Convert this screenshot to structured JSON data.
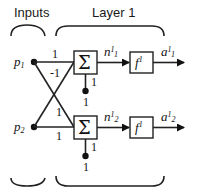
{
  "diagram": {
    "section_labels": {
      "inputs": "Inputs",
      "layer": "Layer 1"
    },
    "inputs": [
      {
        "symbol": "p",
        "sub": "1"
      },
      {
        "symbol": "p",
        "sub": "2"
      }
    ],
    "weights": {
      "w11": "1",
      "w12": "-1",
      "w21": "1",
      "w22": "1"
    },
    "neurons": [
      {
        "sum_symbol": "Σ",
        "bias_label": "1",
        "bias_input": "1",
        "net": {
          "symbol": "n",
          "sup": "1",
          "sub": "1"
        },
        "transfer": {
          "symbol": "f",
          "sup": "1"
        },
        "output": {
          "symbol": "a",
          "sup": "1",
          "sub": "1"
        }
      },
      {
        "sum_symbol": "Σ",
        "bias_label": "1",
        "bias_input": "1",
        "net": {
          "symbol": "n",
          "sup": "1",
          "sub": "2"
        },
        "transfer": {
          "symbol": "f",
          "sup": "1"
        },
        "output": {
          "symbol": "a",
          "sup": "1",
          "sub": "2"
        }
      }
    ]
  }
}
